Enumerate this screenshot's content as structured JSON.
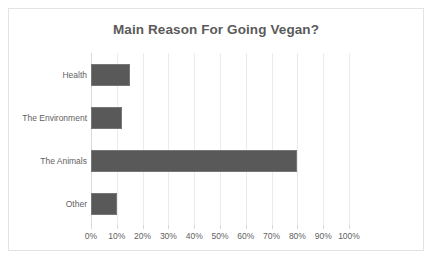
{
  "chart_data": {
    "type": "bar",
    "orientation": "horizontal",
    "title": "Main Reason For Going Vegan?",
    "xlabel": "",
    "ylabel": "",
    "categories": [
      "Health",
      "The Environment",
      "The Animals",
      "Other"
    ],
    "values": [
      15,
      12,
      80,
      10
    ],
    "value_suffix": "%",
    "xlim": [
      0,
      100
    ],
    "xticks": [
      0,
      10,
      20,
      30,
      40,
      50,
      60,
      70,
      80,
      90,
      100
    ],
    "xtick_labels": [
      "0%",
      "10%",
      "20%",
      "30%",
      "40%",
      "50%",
      "60%",
      "70%",
      "80%",
      "90%",
      "100%"
    ],
    "grid": true,
    "grid_axis": "x",
    "legend": false,
    "series": [
      {
        "name": "Main Reason",
        "values": [
          15,
          12,
          80,
          10
        ]
      }
    ],
    "colors": {
      "bar_fill": "#595959",
      "bar_border": "#767676",
      "title_text": "#5a5a5a",
      "tick_text": "#5f5f5f",
      "gridline": "#ebebeb",
      "axis_line": "#d9d9d9",
      "frame_border": "#e3e3e3",
      "background": "#ffffff"
    }
  }
}
